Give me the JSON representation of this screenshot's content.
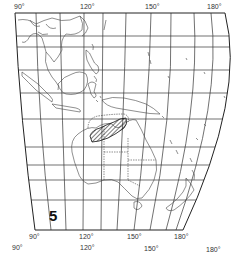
{
  "map": {
    "figure_number": "5",
    "projection": "curved graticule (Asia-Pacific / Australasia)",
    "top_longitude_labels": [
      "90°",
      "120°",
      "150°",
      "180°"
    ],
    "bottom_longitude_labels": [
      "90°",
      "120°",
      "150°",
      "180°"
    ],
    "lower_cutoff_labels": [
      "90°",
      "120°",
      "150°",
      "180°"
    ],
    "highlighted_region": {
      "description": "hatched area over northern Australia / Arafura Sea region",
      "style": "diagonal hatching"
    },
    "regions_shown": [
      "Southeast Asia",
      "Indonesia",
      "Philippines",
      "New Guinea",
      "Australia",
      "New Zealand",
      "Pacific islands"
    ],
    "colors": {
      "background": "#ffffff",
      "lines": "#222222",
      "grid": "#333333",
      "coast": "#444444"
    }
  }
}
